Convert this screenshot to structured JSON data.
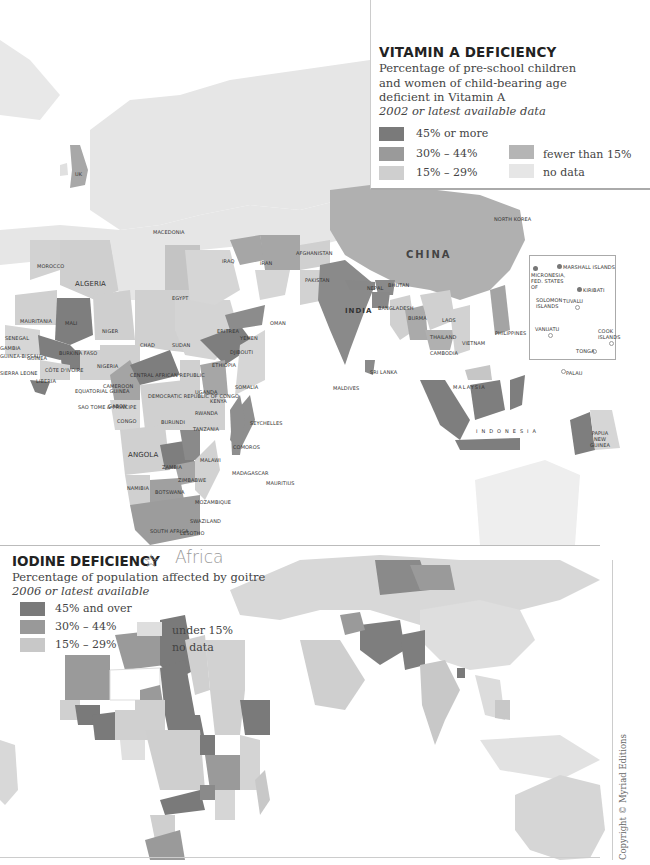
{
  "vitamin_a": {
    "title": "VITAMIN A DEFICIENCY",
    "subtitle_lines": [
      "Percentage of pre-school children",
      "and women of child-bearing age",
      "deficient in Vitamin A"
    ],
    "date_note": "2002 or latest available data",
    "legend": [
      {
        "label": "45% or more",
        "color": "#7a7a7a"
      },
      {
        "label": "30% – 44%",
        "color": "#9a9a9a"
      },
      {
        "label": "15% – 29%",
        "color": "#cfcfcf"
      },
      {
        "label": "fewer than 15%",
        "color": "#b5b5b5"
      },
      {
        "label": "no data",
        "color": "#e6e6e6"
      }
    ],
    "labels": {
      "uk": "UK",
      "macedonia": "MACEDONIA",
      "morocco": "MOROCCO",
      "algeria": "ALGERIA",
      "egypt": "EGYPT",
      "mauritania": "MAURITANIA",
      "mali": "MALI",
      "niger": "NIGER",
      "chad": "CHAD",
      "sudan": "SUDAN",
      "senegal": "SENEGAL",
      "gambia": "GAMBIA",
      "guinea_bissau": "GUINEA-BISSAU",
      "guinea": "GUINEA",
      "burkina_faso": "BURKINA FASO",
      "cote_divoire": "CÔTE D'IVOIRE",
      "ghana": "GHANA",
      "togo": "TOGO",
      "benin": "BENIN",
      "nigeria": "NIGERIA",
      "sierra_leone": "SIERRA LEONE",
      "liberia": "LIBERIA",
      "cameroon": "CAMEROON",
      "car": "CENTRAL AFRICAN REPUBLIC",
      "eq_guinea": "EQUATORIAL GUINEA",
      "sao_tome": "SAO TOME & PRINCIPE",
      "gabon": "GABON",
      "congo": "CONGO",
      "drc": "DEMOCRATIC REPUBLIC OF CONGO",
      "eritrea": "ERITREA",
      "yemen": "YEMEN",
      "djibouti": "DJIBOUTI",
      "ethiopia": "ETHIOPIA",
      "somalia": "SOMALIA",
      "uganda": "UGANDA",
      "kenya": "KENYA",
      "rwanda": "RWANDA",
      "burundi": "BURUNDI",
      "tanzania": "TANZANIA",
      "seychelles": "SEYCHELLES",
      "comoros": "COMOROS",
      "angola": "ANGOLA",
      "malawi": "MALAWI",
      "zambia": "ZAMBIA",
      "zimbabwe": "ZIMBABWE",
      "madagascar": "MADAGASCAR",
      "mauritius": "MAURITIUS",
      "namibia": "NAMIBIA",
      "botswana": "BOTSWANA",
      "mozambique": "MOZAMBIQUE",
      "swaziland": "SWAZILAND",
      "lesotho": "LESOTHO",
      "south_africa": "SOUTH AFRICA",
      "iraq": "IRAQ",
      "iran": "IRAN",
      "afghanistan": "AFGHANISTAN",
      "pakistan": "PAKISTAN",
      "oman": "OMAN",
      "india": "INDIA",
      "nepal": "NEPAL",
      "bhutan": "BHUTAN",
      "bangladesh": "BANGLADESH",
      "sri_lanka": "SRI LANKA",
      "maldives": "MALDIVES",
      "china": "CHINA",
      "north_korea": "NORTH KOREA",
      "burma": "BURMA",
      "laos": "LAOS",
      "thailand": "THAILAND",
      "cambodia": "CAMBODIA",
      "vietnam": "VIETNAM",
      "philippines": "PHILIPPINES",
      "malaysia": "MALAYSIA",
      "indonesia": "INDONESIA",
      "papua": "PAPUA NEW GUINEA",
      "palau": "PALAU",
      "micronesia": "MICRONESIA, FED. STATES OF",
      "marshall": "MARSHALL ISLANDS",
      "kiribati": "KIRIBATI",
      "solomon": "SOLOMON ISLANDS",
      "tuvalu": "TUVALU",
      "vanuatu": "VANUATU",
      "cook": "COOK ISLANDS",
      "tonga": "TONGA"
    }
  },
  "iodine": {
    "title": "IODINE DEFICIENCY",
    "handwritten_note": "Africa",
    "subtitle": "Percentage of population affected by goitre",
    "date_note": "2006 or latest available",
    "legend": [
      {
        "label": "45% and over",
        "color": "#7a7a7a"
      },
      {
        "label": "30% – 44%",
        "color": "#999999"
      },
      {
        "label": "15% – 29%",
        "color": "#c8c8c8"
      },
      {
        "label": "under 15%",
        "color": "#dedede"
      },
      {
        "label": "no data",
        "color": "#ffffff"
      }
    ]
  },
  "copyright": "Copyright © Myriad Editions"
}
